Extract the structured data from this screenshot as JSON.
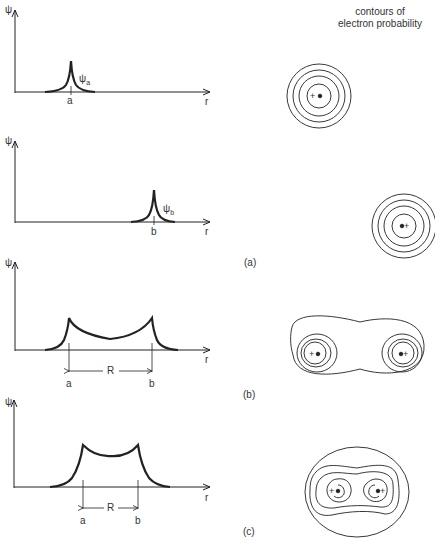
{
  "figure": {
    "contours_title_line1": "contours of",
    "contours_title_line2": "electron probability",
    "panel_labels": {
      "a": "(a)",
      "b": "(b)",
      "c": "(c)"
    },
    "panels": [
      {
        "id": "a1",
        "y_axis": "ψ",
        "x_axis": "r",
        "markers": [
          "a"
        ],
        "curve_label": "ψa",
        "curve_label_main": "ψ",
        "curve_label_sub": "a"
      },
      {
        "id": "a2",
        "y_axis": "ψ",
        "x_axis": "r",
        "markers": [
          "b"
        ],
        "curve_label": "ψb",
        "curve_label_main": "ψ",
        "curve_label_sub": "b"
      },
      {
        "id": "b",
        "y_axis": "ψ",
        "x_axis": "r",
        "markers": [
          "a",
          "b"
        ],
        "separation": "R"
      },
      {
        "id": "c",
        "y_axis": "ψ",
        "x_axis": "r",
        "markers": [
          "a",
          "b"
        ],
        "separation": "R"
      }
    ],
    "nucleus_symbol": "+"
  },
  "colors": {
    "line": "#222222",
    "background": "#ffffff"
  }
}
